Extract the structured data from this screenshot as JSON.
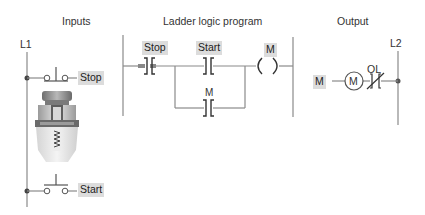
{
  "sections": {
    "inputs_title": "Inputs",
    "ladder_title": "Ladder logic program",
    "output_title": "Output"
  },
  "rails": {
    "left": "L1",
    "right": "L2"
  },
  "inputs": {
    "stop_label": "Stop",
    "start_label": "Start",
    "stop_type": "normally-closed pushbutton",
    "start_type": "normally-open pushbutton"
  },
  "ladder": {
    "contacts": [
      {
        "label": "Stop",
        "type": "examine-if-closed",
        "highlighted": true
      },
      {
        "label": "Start",
        "type": "examine-if-closed",
        "highlighted": true
      },
      {
        "label": "M",
        "type": "examine-if-closed",
        "branch": "parallel-seal-in"
      }
    ],
    "coil": {
      "label": "M",
      "type": "output-coil"
    }
  },
  "output": {
    "input_tag": "M",
    "motor_label": "M",
    "overload_label": "OL"
  },
  "colors": {
    "line": "#8a8a8a",
    "tag_bg": "#dcdcdc",
    "text": "#333333"
  }
}
